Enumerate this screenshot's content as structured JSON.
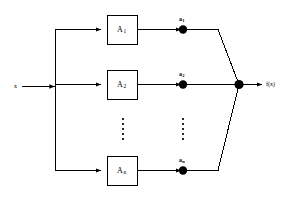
{
  "figure": {
    "type": "block-diagram",
    "colors": {
      "stroke": "#000000",
      "background": "#ffffff",
      "node_fill": "#000000"
    }
  },
  "input": {
    "label": "x"
  },
  "output": {
    "label": "f(x)"
  },
  "branches": [
    {
      "block_label": "A",
      "block_subscript": "1",
      "node_label": "a",
      "node_subscript": "1"
    },
    {
      "block_label": "A",
      "block_subscript": "2",
      "node_label": "a",
      "node_subscript": "2"
    },
    {
      "block_label": "A",
      "block_subscript": "n",
      "node_label": "a",
      "node_subscript": "n"
    }
  ],
  "ellipsis": {
    "dot_count": 5,
    "columns": [
      {
        "name": "blocks-ellipsis"
      },
      {
        "name": "nodes-ellipsis"
      }
    ]
  },
  "summing_junction": {
    "name": "summing-junction"
  }
}
